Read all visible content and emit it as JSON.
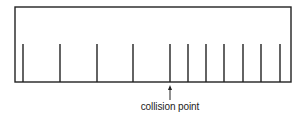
{
  "diagram": {
    "label": "collision point",
    "stroke_color": "#222222",
    "box": {
      "left": 15,
      "top": 7,
      "right": 291,
      "bottom": 82
    },
    "tick_top": 44,
    "ticks_x": [
      23,
      60,
      97,
      133,
      170,
      188,
      206,
      224,
      243,
      261,
      280
    ],
    "collision_tick_index": 4,
    "arrow": {
      "x": 170,
      "tip_y": 85,
      "tail_y": 100
    }
  }
}
